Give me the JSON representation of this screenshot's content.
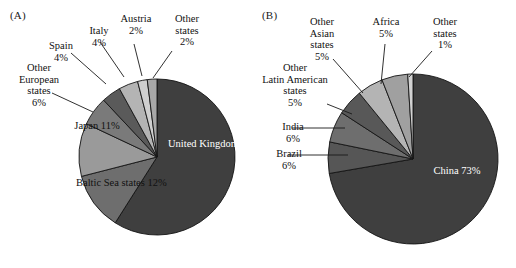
{
  "figure": {
    "background": "#ffffff",
    "width": 516,
    "height": 268
  },
  "panels": [
    {
      "tag": "(A)"
    },
    {
      "tag": "(B)"
    }
  ],
  "chart_data": [
    {
      "type": "pie",
      "panel": "(A)",
      "title": "",
      "start_angle_deg": 0,
      "direction": "clockwise",
      "categories": [
        "United Kingdom",
        "Baltic Sea states",
        "Japan",
        "Other European states",
        "Spain",
        "Italy",
        "Austria",
        "Other states"
      ],
      "values": [
        59,
        12,
        11,
        6,
        4,
        4,
        2,
        2
      ],
      "value_labels": [
        "59%",
        "12%",
        "11%",
        "6%",
        "4%",
        "4%",
        "2%",
        "2%"
      ],
      "colors": [
        "#3f3f3f",
        "#6e6e6e",
        "#9a9a9a",
        "#7a7a7a",
        "#5a5a5a",
        "#b4b4b4",
        "#cfcfcf",
        "#a8a8a8"
      ],
      "label_placement": [
        "inside",
        "inside",
        "inside",
        "outside",
        "outside",
        "outside",
        "outside",
        "outside"
      ],
      "legend": "none",
      "grid": false
    },
    {
      "type": "pie",
      "panel": "(B)",
      "title": "",
      "start_angle_deg": 0,
      "direction": "clockwise",
      "categories": [
        "China",
        "Brazil",
        "India",
        "Other Latin American states",
        "Other Asian states",
        "Africa",
        "Other states"
      ],
      "values": [
        73,
        6,
        6,
        5,
        5,
        5,
        1
      ],
      "value_labels": [
        "73%",
        "6%",
        "6%",
        "5%",
        "5%",
        "5%",
        "1%"
      ],
      "colors": [
        "#3f3f3f",
        "#565656",
        "#6e6e6e",
        "#585858",
        "#b4b4b4",
        "#a0a0a0",
        "#d2d2d2"
      ],
      "label_placement": [
        "inside",
        "outside",
        "outside",
        "outside",
        "outside",
        "outside",
        "outside"
      ],
      "legend": "none",
      "grid": false
    }
  ],
  "labels_a": {
    "united_kingdom": {
      "name": "United",
      "name2": "Kingdom",
      "pct": "59%"
    },
    "baltic": {
      "name": "Baltic Sea",
      "name2": "states",
      "pct": "12%"
    },
    "japan": {
      "name": "Japan",
      "pct": "11%"
    },
    "other_european": {
      "name": "Other",
      "name2": "European",
      "name3": "states",
      "pct": "6%"
    },
    "spain": {
      "name": "Spain",
      "pct": "4%"
    },
    "italy": {
      "name": "Italy",
      "pct": "4%"
    },
    "austria": {
      "name": "Austria",
      "pct": "2%"
    },
    "other_states": {
      "name": "Other",
      "name2": "states",
      "pct": "2%"
    }
  },
  "labels_b": {
    "china": {
      "name": "China",
      "pct": "73%"
    },
    "brazil": {
      "name": "Brazil",
      "pct": "6%"
    },
    "india": {
      "name": "India",
      "pct": "6%"
    },
    "other_latin": {
      "name": "Other",
      "name2": "Latin American",
      "name3": "states",
      "pct": "5%"
    },
    "other_asian": {
      "name": "Other",
      "name2": "Asian",
      "name3": "states",
      "pct": "5%"
    },
    "africa": {
      "name": "Africa",
      "pct": "5%"
    },
    "other_states": {
      "name": "Other",
      "name2": "states",
      "pct": "1%"
    }
  }
}
